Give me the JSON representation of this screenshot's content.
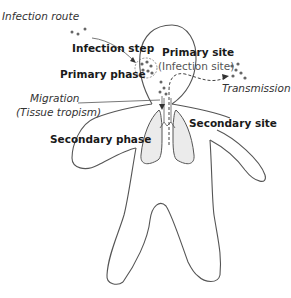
{
  "diagram": {
    "labels": {
      "infection_route": "Infection route",
      "infection_step": "Infection step",
      "primary_phase": "Primary phase",
      "primary_site": "Primary site",
      "infection_site": "(Infection site)",
      "transmission": "Transmission",
      "migration": "Migration",
      "tissue_tropism": "(Tissue tropism)",
      "secondary_phase": "Secondary phase",
      "secondary_site": "Secondary site"
    },
    "colors": {
      "outline": "#555555",
      "lung_fill": "#ebebeb",
      "text": "#1a1a1a",
      "particle": "#666666"
    }
  }
}
